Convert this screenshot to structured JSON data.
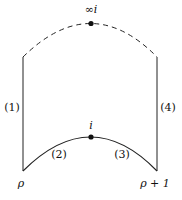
{
  "figure": {
    "points": {
      "top": "∞i",
      "mid": "i",
      "left_corner": "ρ",
      "right_corner": "ρ + 1"
    },
    "edges": {
      "left": "(1)",
      "bottom_left": "(2)",
      "bottom_right": "(3)",
      "right": "(4)"
    },
    "colors": {
      "stroke": "#111111",
      "background": "#ffffff"
    }
  }
}
